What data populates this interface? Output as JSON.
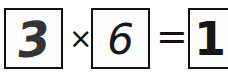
{
  "equation": {
    "operand_a": "3",
    "operator": "×",
    "operand_b": "6",
    "equals": "=",
    "result": "18"
  },
  "colors": {
    "ink": "#111111",
    "background": "#ffffff"
  }
}
